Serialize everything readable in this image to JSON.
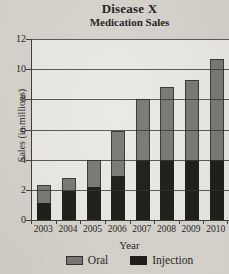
{
  "title": "Disease X",
  "subtitle": "Medication Sales",
  "chart_data": {
    "type": "bar",
    "stacked": true,
    "title": "Disease X",
    "subtitle": "Medication Sales",
    "xlabel": "Year",
    "ylabel": "Sales (in millions)",
    "categories": [
      "2003",
      "2004",
      "2005",
      "2006",
      "2007",
      "2008",
      "2009",
      "2010"
    ],
    "series": [
      {
        "name": "Injection",
        "color": "#191814",
        "values": [
          1.1,
          1.9,
          2.2,
          2.9,
          4.0,
          4.0,
          4.0,
          4.0
        ]
      },
      {
        "name": "Oral",
        "color": "#787670",
        "values": [
          1.2,
          0.9,
          1.8,
          3.0,
          4.0,
          4.8,
          5.3,
          6.7
        ]
      }
    ],
    "totals": [
      2.3,
      2.8,
      4.0,
      5.9,
      8.0,
      8.8,
      9.3,
      10.7
    ],
    "ylim": [
      0,
      12
    ],
    "yticks": [
      0,
      2,
      4,
      6,
      8,
      10,
      12
    ],
    "grid": true,
    "legend": {
      "items": [
        "Oral",
        "Injection"
      ],
      "position": "bottom"
    }
  },
  "colors": {
    "paper": "#d7d4ce",
    "plot_background": "#ebe9e3",
    "axis": "#3a3934",
    "oral_bar": "#787670",
    "injection_bar": "#191814",
    "text": "#1c1a17"
  }
}
